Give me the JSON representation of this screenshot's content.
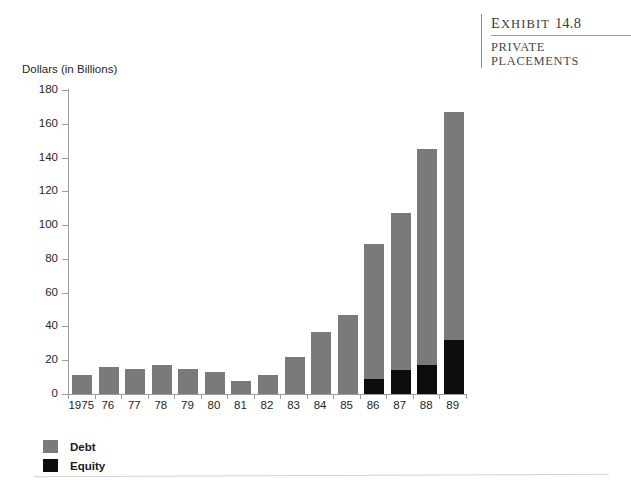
{
  "exhibit": {
    "label_word": "Exhibit",
    "label_number": "14.8",
    "subtitle_line1": "PRIVATE",
    "subtitle_line2": "PLACEMENTS"
  },
  "legend": {
    "debt_label": "Debt",
    "equity_label": "Equity",
    "debt_color": "#7a7a7a",
    "equity_color": "#0d0d0d"
  },
  "chart_data": {
    "type": "bar",
    "stacked": true,
    "title": "",
    "xlabel": "",
    "ylabel": "Dollars (in Billions)",
    "ylim": [
      0,
      180
    ],
    "yticks": [
      0,
      20,
      40,
      60,
      80,
      100,
      120,
      140,
      160,
      180
    ],
    "grid": false,
    "legend_position": "bottom-left",
    "categories": [
      "1975",
      "76",
      "77",
      "78",
      "79",
      "80",
      "81",
      "82",
      "83",
      "84",
      "85",
      "86",
      "87",
      "88",
      "89"
    ],
    "series": [
      {
        "name": "Equity",
        "color": "#0d0d0d",
        "values": [
          0,
          0,
          0,
          0,
          0,
          0,
          0,
          0,
          0,
          0,
          0,
          9,
          14,
          17,
          32
        ]
      },
      {
        "name": "Debt",
        "color": "#7a7a7a",
        "values": [
          11,
          16,
          15,
          17,
          15,
          13,
          8,
          11,
          22,
          37,
          47,
          80,
          93,
          128,
          135
        ]
      }
    ],
    "totals": [
      11,
      16,
      15,
      17,
      15,
      13,
      8,
      11,
      22,
      37,
      47,
      89,
      107,
      145,
      167
    ]
  }
}
